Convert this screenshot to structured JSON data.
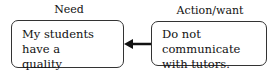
{
  "diagram": {
    "nodes": [
      {
        "id": "need",
        "heading": "Need",
        "text_lines": [
          "My students have a",
          "quality education."
        ]
      },
      {
        "id": "action",
        "heading": "Action/want",
        "text_lines": [
          "Do not communicate",
          "with tutors."
        ]
      }
    ],
    "edges": [
      {
        "from": "action",
        "to": "need",
        "style": "arrow"
      }
    ]
  }
}
